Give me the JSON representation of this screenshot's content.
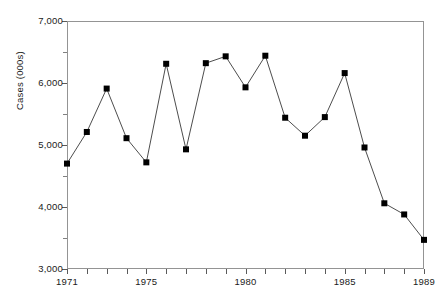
{
  "chart_data": {
    "type": "line",
    "title": "",
    "subtitle": "",
    "xlabel": "",
    "ylabel": "Cases (000s)",
    "x": [
      1971,
      1972,
      1973,
      1974,
      1975,
      1976,
      1977,
      1978,
      1979,
      1980,
      1981,
      1982,
      1983,
      1984,
      1985,
      1986,
      1987,
      1988,
      1989
    ],
    "values": [
      4700,
      5210,
      5910,
      5110,
      4720,
      6310,
      4930,
      6320,
      6430,
      5930,
      6440,
      5440,
      5150,
      5450,
      6160,
      4960,
      4060,
      3880,
      3470
    ],
    "series": [
      {
        "name": "Cases",
        "values": [
          4700,
          5210,
          5910,
          5110,
          4720,
          6310,
          4930,
          6320,
          6430,
          5930,
          6440,
          5440,
          5150,
          5450,
          6160,
          4960,
          4060,
          3880,
          3470
        ]
      }
    ],
    "xlim": [
      1971,
      1989
    ],
    "ylim": [
      3000,
      7000
    ],
    "y_major_ticks": [
      3000,
      4000,
      5000,
      6000,
      7000
    ],
    "y_tick_labels": [
      "3,000",
      "4,000",
      "5,000",
      "6,000",
      "7,000"
    ],
    "y_minor_interval": 500,
    "x_tick_years": [
      1971,
      1972,
      1973,
      1974,
      1975,
      1976,
      1977,
      1978,
      1979,
      1980,
      1981,
      1982,
      1983,
      1984,
      1985,
      1986,
      1987,
      1988,
      1989
    ],
    "x_labeled_years": [
      1971,
      1975,
      1980,
      1985,
      1989
    ],
    "x_tick_labels": [
      "1971",
      "1975",
      "1980",
      "1985",
      "1989"
    ],
    "grid": false,
    "legend": false,
    "legend_position": "none",
    "marker": "square",
    "marker_color": "#000000",
    "line_color": "#4d4d4d",
    "frame_color": "#949494",
    "background_color": "#ffffff"
  }
}
